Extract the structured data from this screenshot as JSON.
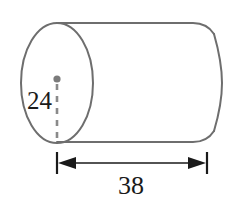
{
  "figure": {
    "name": "cylinder-with-dimensions",
    "shape": "cylinder",
    "background_color": "#ffffff",
    "outline_color": "#6e6e6e",
    "dimension_color": "#1a1a1a",
    "text_color": "#1a1a1a",
    "labels": {
      "diameter": "24",
      "length": "38"
    },
    "annotations": {
      "center_dot": "center-point-dot",
      "radius_guide": "dashed-radius-line",
      "length_dimension": "length-dimension-line"
    },
    "geometry": {
      "ellipse_center_x": 57,
      "ellipse_center_y": 83,
      "ellipse_rx": 36,
      "ellipse_ry": 60,
      "body_top_y": 23,
      "body_bottom_y": 142,
      "body_right_x": 207,
      "far_end_bulge_x": 222,
      "center_dot_x": 57,
      "center_dot_y": 79,
      "dash_end_y": 143,
      "dimension_line_y": 163,
      "dimension_left_x": 57,
      "dimension_right_x": 207
    }
  }
}
